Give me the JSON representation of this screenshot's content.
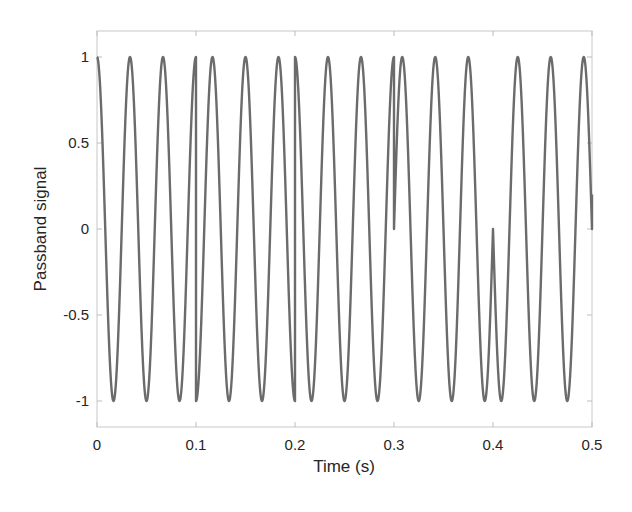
{
  "chart_data": {
    "type": "line",
    "title": "",
    "xlabel": "Time (s)",
    "ylabel": "Passband signal",
    "xlim": [
      0,
      0.5
    ],
    "ylim": [
      -1.15,
      1.15
    ],
    "grid": false,
    "legend": null,
    "x_ticks": [
      0,
      0.1,
      0.2,
      0.3,
      0.4,
      0.5
    ],
    "x_tick_labels": [
      "0",
      "0.1",
      "0.2",
      "0.3",
      "0.4",
      "0.5"
    ],
    "y_ticks": [
      -1,
      -0.5,
      0,
      0.5,
      1
    ],
    "y_tick_labels": [
      "-1",
      "-0.5",
      "0",
      "0.5",
      "1"
    ],
    "series": [
      {
        "name": "Passband signal",
        "color": "#6b6b6b",
        "line_width": 2.2,
        "description": "Carrier cos(2*pi*fc*t + phase) with phase switching every 0.1 s",
        "carrier_hz": 30,
        "segment_duration_s": 0.1,
        "segments": [
          {
            "t_start": 0.0,
            "t_end": 0.1,
            "phase_rad": 0,
            "start_value": 1
          },
          {
            "t_start": 0.1,
            "t_end": 0.2,
            "phase_rad": 3.14159,
            "start_value": -1
          },
          {
            "t_start": 0.2,
            "t_end": 0.3,
            "phase_rad": 0,
            "start_value": 1
          },
          {
            "t_start": 0.3,
            "t_end": 0.4,
            "phase_rad": -1.5708,
            "start_value": 0
          },
          {
            "t_start": 0.4,
            "t_end": 0.5,
            "phase_rad": 1.5708,
            "start_value": 0
          }
        ],
        "end_value": 0.2
      }
    ]
  }
}
